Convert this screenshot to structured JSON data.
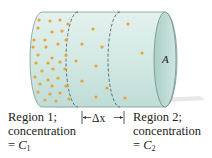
{
  "diagram": {
    "type": "diffusion-cylinder",
    "area_label": "A",
    "delta_label": "Δx",
    "colors": {
      "cylinder_fill": "#d6ebe6",
      "cylinder_stroke": "#6f8f8a",
      "end_cap_fill": "#b9d9d2",
      "particle": "#e8a23a",
      "dash": "#4a5f6a"
    },
    "region1": {
      "line1": "Region 1;",
      "line2": "concentration",
      "line3_prefix": "= ",
      "symbol": "C",
      "subscript": "1"
    },
    "region2": {
      "line1": "Region 2;",
      "line2": "concentration",
      "line3_prefix": "= ",
      "symbol": "C",
      "subscript": "2"
    }
  }
}
